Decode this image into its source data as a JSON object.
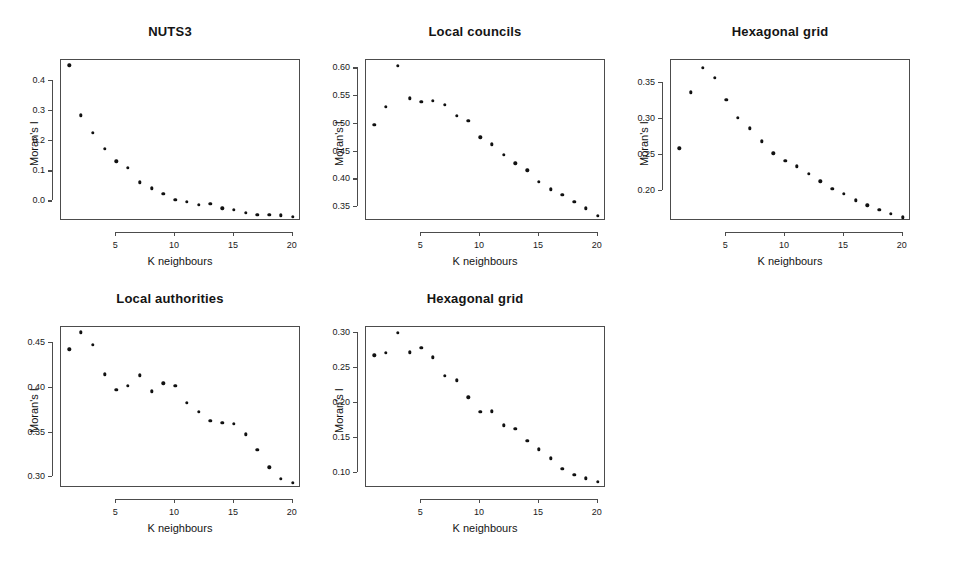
{
  "figure": {
    "background": "#ffffff",
    "point_color": "#111111",
    "axis_color": "#4c4c4c",
    "xlabel": "K neighbours",
    "ylabel": "Moran's I",
    "layout": "2 rows x 3 columns, 5 panels"
  },
  "chart_data": [
    {
      "type": "scatter",
      "title": "NUTS3",
      "xlabel": "K neighbours",
      "ylabel": "Moran's I",
      "xlim": [
        0.3,
        20.7
      ],
      "ylim": [
        -0.065,
        0.47
      ],
      "xticks": [
        5,
        10,
        15,
        20
      ],
      "xtick_labels": [
        "5",
        "10",
        "15",
        "20"
      ],
      "yticks": [
        0.0,
        0.1,
        0.2,
        0.3,
        0.4
      ],
      "ytick_labels": [
        "0.0",
        "0.1",
        "0.2",
        "0.3",
        "0.4"
      ],
      "grid": false,
      "legend": "none",
      "x": [
        1,
        2,
        3,
        4,
        5,
        6,
        7,
        8,
        9,
        10,
        11,
        12,
        13,
        14,
        15,
        16,
        17,
        18,
        19,
        20
      ],
      "values": [
        0.452,
        0.286,
        0.229,
        0.175,
        0.133,
        0.111,
        0.063,
        0.044,
        0.026,
        0.006,
        -0.002,
        -0.012,
        -0.008,
        -0.023,
        -0.028,
        -0.038,
        -0.044,
        -0.045,
        -0.046,
        -0.052
      ]
    },
    {
      "type": "scatter",
      "title": "Local councils",
      "xlabel": "K neighbours",
      "ylabel": "Moran's I",
      "xlim": [
        0.3,
        20.7
      ],
      "ylim": [
        0.325,
        0.615
      ],
      "xticks": [
        5,
        10,
        15,
        20
      ],
      "xtick_labels": [
        "5",
        "10",
        "15",
        "20"
      ],
      "yticks": [
        0.35,
        0.4,
        0.45,
        0.5,
        0.55,
        0.6
      ],
      "ytick_labels": [
        "0.35",
        "0.40",
        "0.45",
        "0.50",
        "0.55",
        "0.60"
      ],
      "grid": false,
      "legend": "none",
      "x": [
        1,
        2,
        3,
        4,
        5,
        6,
        7,
        8,
        9,
        10,
        11,
        12,
        13,
        14,
        15,
        16,
        17,
        18,
        19,
        20
      ],
      "values": [
        0.498,
        0.531,
        0.604,
        0.546,
        0.54,
        0.541,
        0.534,
        0.514,
        0.506,
        0.476,
        0.463,
        0.444,
        0.429,
        0.416,
        0.396,
        0.382,
        0.372,
        0.36,
        0.348,
        0.334
      ]
    },
    {
      "type": "scatter",
      "title": "Hexagonal grid",
      "xlabel": "K neighbours",
      "ylabel": "Moran's I",
      "xlim": [
        0.3,
        20.7
      ],
      "ylim": [
        0.158,
        0.382
      ],
      "xticks": [
        5,
        10,
        15,
        20
      ],
      "xtick_labels": [
        "5",
        "10",
        "15",
        "20"
      ],
      "yticks": [
        0.2,
        0.25,
        0.3,
        0.35
      ],
      "ytick_labels": [
        "0.20",
        "0.25",
        "0.30",
        "0.35"
      ],
      "grid": false,
      "legend": "none",
      "x": [
        1,
        2,
        3,
        4,
        5,
        6,
        7,
        8,
        9,
        10,
        11,
        12,
        13,
        14,
        15,
        16,
        17,
        18,
        19,
        20
      ],
      "values": [
        0.259,
        0.337,
        0.371,
        0.357,
        0.327,
        0.302,
        0.287,
        0.269,
        0.252,
        0.242,
        0.234,
        0.224,
        0.213,
        0.203,
        0.196,
        0.187,
        0.18,
        0.174,
        0.168,
        0.163
      ]
    },
    {
      "type": "scatter",
      "title": "Local authorities",
      "xlabel": "K neighbours",
      "ylabel": "Moran's I",
      "xlim": [
        0.3,
        20.7
      ],
      "ylim": [
        0.288,
        0.468
      ],
      "xticks": [
        5,
        10,
        15,
        20
      ],
      "xtick_labels": [
        "5",
        "10",
        "15",
        "20"
      ],
      "yticks": [
        0.3,
        0.35,
        0.4,
        0.45
      ],
      "ytick_labels": [
        "0.30",
        "0.35",
        "0.40",
        "0.45"
      ],
      "grid": false,
      "legend": "none",
      "x": [
        1,
        2,
        3,
        4,
        5,
        6,
        7,
        8,
        9,
        10,
        11,
        12,
        13,
        14,
        15,
        16,
        17,
        18,
        19,
        20
      ],
      "values": [
        0.443,
        0.462,
        0.448,
        0.415,
        0.398,
        0.402,
        0.414,
        0.396,
        0.405,
        0.402,
        0.383,
        0.373,
        0.363,
        0.361,
        0.36,
        0.348,
        0.331,
        0.311,
        0.298,
        0.294
      ]
    },
    {
      "type": "scatter",
      "title": "Hexagonal grid",
      "xlabel": "K neighbours",
      "ylabel": "Moran's I",
      "xlim": [
        0.3,
        20.7
      ],
      "ylim": [
        0.079,
        0.308
      ],
      "xticks": [
        5,
        10,
        15,
        20
      ],
      "xtick_labels": [
        "5",
        "10",
        "15",
        "20"
      ],
      "yticks": [
        0.1,
        0.15,
        0.2,
        0.25,
        0.3
      ],
      "ytick_labels": [
        "0.10",
        "0.15",
        "0.20",
        "0.25",
        "0.30"
      ],
      "grid": false,
      "legend": "none",
      "x": [
        1,
        2,
        3,
        4,
        5,
        6,
        7,
        8,
        9,
        10,
        11,
        12,
        13,
        14,
        15,
        16,
        17,
        18,
        19,
        20
      ],
      "values": [
        0.268,
        0.271,
        0.3,
        0.272,
        0.278,
        0.265,
        0.239,
        0.232,
        0.208,
        0.187,
        0.188,
        0.168,
        0.163,
        0.146,
        0.134,
        0.121,
        0.106,
        0.098,
        0.093,
        0.088
      ]
    }
  ],
  "panel_positions": [
    {
      "left": 20,
      "top": 14
    },
    {
      "left": 325,
      "top": 14
    },
    {
      "left": 630,
      "top": 14
    },
    {
      "left": 20,
      "top": 281
    },
    {
      "left": 325,
      "top": 281
    }
  ]
}
